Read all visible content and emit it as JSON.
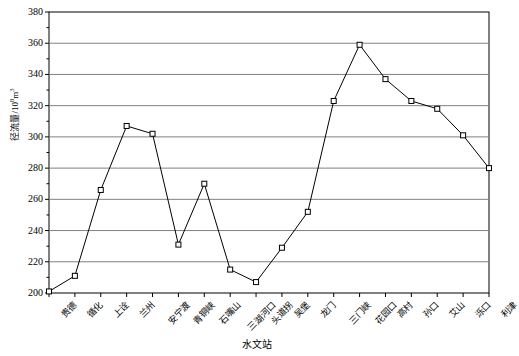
{
  "chart_data": {
    "type": "line",
    "title": "",
    "xlabel": "水文站",
    "ylabel": "径流量/10",
    "ylabel_sup": "8",
    "ylabel_unit": "m",
    "ylabel_unit_sup": "3",
    "ylim": [
      200,
      380
    ],
    "ytick_step": 20,
    "yticks": [
      200,
      220,
      240,
      260,
      280,
      300,
      320,
      340,
      360,
      380
    ],
    "grid": "horizontal",
    "legend": "none",
    "marker": "open-square",
    "line_color": "#000000",
    "grid_color": "#808080",
    "axis_color": "#000000",
    "categories": [
      "贵德",
      "循化",
      "上诠",
      "兰州",
      "安宁渡",
      "青铜峡",
      "石嘴山",
      "三湖河口",
      "头道拐",
      "吴堡",
      "龙门",
      "三门峡",
      "花园口",
      "高村",
      "孙口",
      "艾山",
      "泺口",
      "利津"
    ],
    "values": [
      201,
      211,
      266,
      307,
      302,
      231,
      270,
      215,
      207,
      229,
      252,
      323,
      359,
      337,
      323,
      318,
      301,
      280
    ]
  }
}
